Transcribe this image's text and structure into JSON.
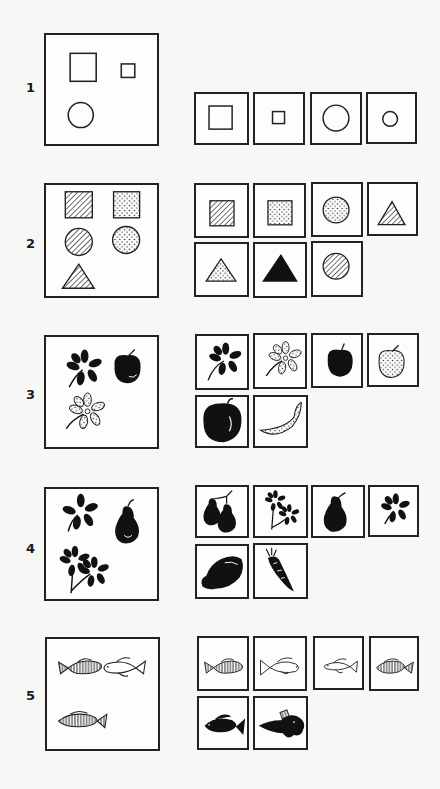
{
  "page": {
    "background": "#f7f7f5",
    "ink": "#222222"
  },
  "sets": [
    {
      "number": "1",
      "sample": [
        "large-square",
        "small-square",
        "circle"
      ],
      "choices": [
        "large-square",
        "small-square",
        "large-circle",
        "small-circle"
      ]
    },
    {
      "number": "2",
      "sample": [
        "hatched-square",
        "dotted-square",
        "hatched-circle",
        "dotted-circle",
        "hatched-triangle"
      ],
      "choices": [
        "hatched-square",
        "dotted-square",
        "dotted-circle",
        "hatched-triangle",
        "dotted-triangle",
        "black-triangle",
        "hatched-circle"
      ]
    },
    {
      "number": "3",
      "sample": [
        "black-flower",
        "black-apple",
        "dotted-flower"
      ],
      "choices": [
        "black-flower",
        "dotted-flower",
        "black-apple",
        "dotted-apple",
        "black-pepper",
        "dotted-peapod"
      ]
    },
    {
      "number": "4",
      "sample": [
        "black-flower",
        "black-pear",
        "two-black-flowers"
      ],
      "choices": [
        "two-black-pears",
        "two-black-flowers",
        "black-pear",
        "black-flower",
        "black-squash",
        "black-carrot"
      ]
    },
    {
      "number": "5",
      "sample": [
        "hatched-fish",
        "outline-fish",
        "hatched-fish"
      ],
      "choices": [
        "hatched-fish",
        "outline-fish-large",
        "outline-fish-small",
        "hatched-fish",
        "black-fish",
        "black-spiny-fish"
      ]
    }
  ]
}
